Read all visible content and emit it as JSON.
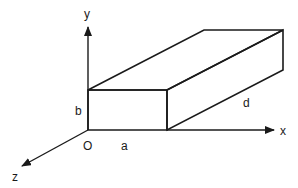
{
  "diagram": {
    "type": "3d-rectangular-box-with-axes",
    "axes": {
      "x_label": "x",
      "y_label": "y",
      "z_label": "z",
      "origin_label": "O"
    },
    "dimensions": {
      "width_label": "a",
      "height_label": "b",
      "depth_label": "d"
    },
    "colors": {
      "ink": "#1a1a1a",
      "background": "#ffffff"
    }
  }
}
